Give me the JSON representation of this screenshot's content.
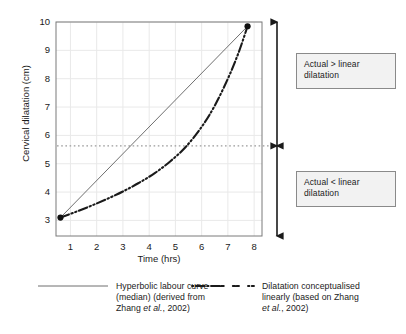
{
  "chart_data": {
    "type": "line",
    "title": "",
    "xlabel": "Time (hrs)",
    "ylabel": "Cervical dilatation (cm)",
    "xlim": [
      0.45,
      8.3
    ],
    "ylim": [
      2.45,
      10
    ],
    "xticks": [
      1,
      2,
      3,
      4,
      5,
      6,
      7,
      8
    ],
    "xtick_labels": [
      "1",
      "2",
      "3",
      "4",
      "5",
      "6",
      "7",
      "8"
    ],
    "yticks": [
      3,
      4,
      5,
      6,
      7,
      8,
      9,
      10
    ],
    "ytick_labels": [
      "3",
      "4",
      "5",
      "6",
      "7",
      "8",
      "9",
      "10"
    ],
    "grid": true,
    "grid_color": "#e9e9e9",
    "legend_position": "below-plot",
    "series": [
      {
        "name": "Hyperbolic labour curve (median) (derived from Zhang et al., 2002)",
        "style": "solid",
        "color": "#6f6f6f",
        "width": 1,
        "x": [
          0.62,
          7.75
        ],
        "y": [
          3.1,
          9.85
        ]
      },
      {
        "name": "Dilatation conceptualised linearly (based on Zhang et al., 2002)",
        "style": "dash-dot",
        "color": "#1a1a1a",
        "width": 2.1,
        "x": [
          0.62,
          1.2,
          1.8,
          2.4,
          3.0,
          3.6,
          4.2,
          4.8,
          5.4,
          6.0,
          6.5,
          7.0,
          7.4,
          7.75
        ],
        "y": [
          3.1,
          3.3,
          3.52,
          3.76,
          4.02,
          4.32,
          4.66,
          5.08,
          5.6,
          6.3,
          7.05,
          8.0,
          8.9,
          9.85
        ]
      }
    ],
    "markers": [
      {
        "name": "start-point",
        "x": 0.62,
        "y": 3.1
      },
      {
        "name": "end-point",
        "x": 7.75,
        "y": 9.85
      }
    ],
    "reference_line": {
      "name": "crossover-dotted-line",
      "orientation": "horizontal",
      "y": 5.63,
      "style": "dotted",
      "color": "#9a9a9a"
    }
  },
  "annotations": {
    "above": {
      "line1": "Actual > linear",
      "line2": "dilatation"
    },
    "below": {
      "line1": "Actual < linear",
      "line2": "dilatation"
    }
  },
  "arrows": {
    "upper": {
      "name": "upper-range-arrow",
      "y_top": 10,
      "y_bottom": 5.63
    },
    "lower": {
      "name": "lower-range-arrow",
      "y_top": 5.63,
      "y_bottom": 2.45
    }
  },
  "legend": {
    "items": [
      {
        "swatch": "solid-line-swatch",
        "line1": "Hyperbolic labour curve",
        "line2": "(median) (derived from",
        "line3_pre": "Zhang ",
        "line3_ital": "et al.",
        "line3_post": ", 2002)"
      },
      {
        "swatch": "dash-dot-line-swatch",
        "line1": "Dilatation conceptualised",
        "line2": "linearly (based on Zhang",
        "line3_ital": "et al.",
        "line3_post": ", 2002)"
      }
    ]
  },
  "axes": {
    "x_label": "Time (hrs)",
    "y_label": "Cervical dilatation (cm)",
    "x_tick_labels": [
      "1",
      "2",
      "3",
      "4",
      "5",
      "6",
      "7",
      "8"
    ],
    "y_tick_labels": [
      "10",
      "9",
      "8",
      "7",
      "6",
      "5",
      "4",
      "3"
    ]
  },
  "colors": {
    "axis": "#7a7a7a",
    "grid": "#ececec",
    "curve_solid": "#6f6f6f",
    "curve_dashdot": "#1a1a1a",
    "dotted_ref": "#9a9a9a",
    "box_fill": "#f2f2f2",
    "box_border": "#8a8a8a",
    "text": "#1a1a1a"
  }
}
